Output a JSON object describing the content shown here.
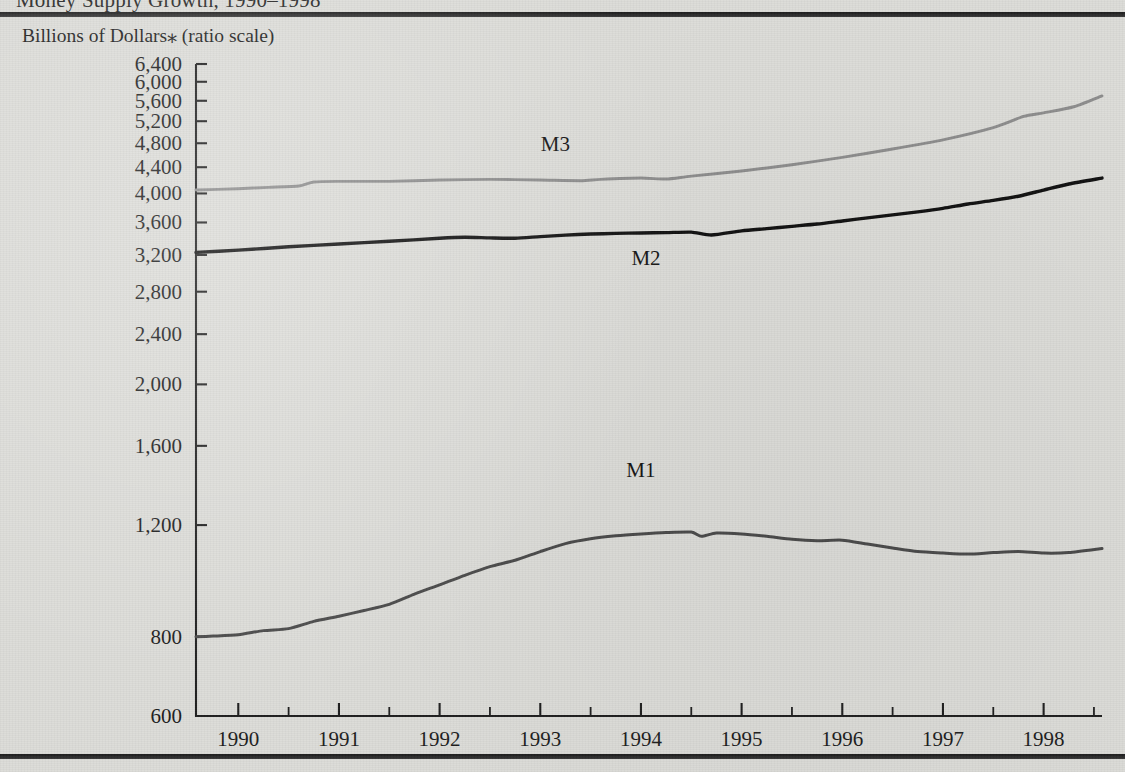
{
  "figure": {
    "clipped_title": "Money Supply Growth, 1990–1998",
    "axis_caption": "Billions of Dollars⁎ (ratio scale)"
  },
  "chart_data": {
    "type": "line",
    "title": "Money Supply Growth, 1990–1998",
    "subtitle": "Billions of Dollars⁎ (ratio scale)",
    "xlabel": "",
    "ylabel": "Billions of Dollars (ratio scale)",
    "scale": "log",
    "grid": false,
    "legend_position": "inline-labels",
    "ylim": [
      600,
      6400
    ],
    "xlim": [
      1989.58,
      1998.58
    ],
    "ytick_labels": [
      "6,400",
      "6,000",
      "5,600",
      "5,200",
      "4,800",
      "4,400",
      "4,000",
      "3,600",
      "3,200",
      "2,800",
      "2,400",
      "2,000",
      "1,600",
      "1,200",
      "800",
      "600"
    ],
    "ytick_values": [
      6400,
      6000,
      5600,
      5200,
      4800,
      4400,
      4000,
      3600,
      3200,
      2800,
      2400,
      2000,
      1600,
      1200,
      800,
      600
    ],
    "xtick_labels": [
      "1990",
      "1991",
      "1992",
      "1993",
      "1994",
      "1995",
      "1996",
      "1997",
      "1998"
    ],
    "xtick_values": [
      1990,
      1991,
      1992,
      1993,
      1994,
      1995,
      1996,
      1997,
      1998
    ],
    "xtick_minor_values": [
      1990.5,
      1991.5,
      1992.5,
      1993.5,
      1994.5,
      1995.5,
      1996.5,
      1997.5,
      1998.5
    ],
    "series": [
      {
        "name": "M1",
        "color": "#4a4a4a",
        "label_x": 1994.0,
        "label_y": 1430,
        "x": [
          1989.58,
          1989.75,
          1990.0,
          1990.25,
          1990.5,
          1990.75,
          1991.0,
          1991.25,
          1991.5,
          1991.75,
          1992.0,
          1992.25,
          1992.5,
          1992.75,
          1993.0,
          1993.25,
          1993.5,
          1993.75,
          1994.0,
          1994.25,
          1994.5,
          1994.6,
          1994.75,
          1995.0,
          1995.25,
          1995.5,
          1995.75,
          1996.0,
          1996.25,
          1996.5,
          1996.75,
          1997.0,
          1997.25,
          1997.5,
          1997.75,
          1998.0,
          1998.25,
          1998.58
        ],
        "y": [
          800,
          802,
          806,
          818,
          824,
          846,
          862,
          880,
          900,
          934,
          966,
          1000,
          1032,
          1056,
          1090,
          1122,
          1142,
          1154,
          1162,
          1168,
          1170,
          1152,
          1166,
          1162,
          1152,
          1140,
          1134,
          1136,
          1120,
          1104,
          1090,
          1084,
          1080,
          1086,
          1090,
          1084,
          1086,
          1102
        ]
      },
      {
        "name": "M2",
        "color": "#111111",
        "label_x": 1994.05,
        "label_y": 3090,
        "x": [
          1989.58,
          1990.0,
          1990.5,
          1991.0,
          1991.5,
          1992.0,
          1992.25,
          1992.5,
          1992.75,
          1993.0,
          1993.25,
          1993.5,
          1993.75,
          1994.0,
          1994.25,
          1994.5,
          1994.7,
          1995.0,
          1995.25,
          1995.5,
          1995.75,
          1996.0,
          1996.25,
          1996.5,
          1996.75,
          1997.0,
          1997.25,
          1997.5,
          1997.75,
          1998.0,
          1998.25,
          1998.58
        ],
        "y": [
          3230,
          3256,
          3296,
          3330,
          3362,
          3400,
          3412,
          3404,
          3400,
          3420,
          3438,
          3452,
          3460,
          3466,
          3470,
          3476,
          3440,
          3492,
          3520,
          3550,
          3580,
          3620,
          3660,
          3700,
          3742,
          3790,
          3850,
          3900,
          3960,
          4050,
          4140,
          4230
        ]
      },
      {
        "name": "M3",
        "color": "#8d8d8d",
        "label_x": 1993.15,
        "label_y": 4660,
        "x": [
          1989.58,
          1990.0,
          1990.3,
          1990.6,
          1990.75,
          1991.0,
          1991.5,
          1992.0,
          1992.5,
          1993.0,
          1993.4,
          1993.6,
          1994.0,
          1994.25,
          1994.5,
          1995.0,
          1995.5,
          1996.0,
          1996.5,
          1997.0,
          1997.5,
          1997.8,
          1998.0,
          1998.3,
          1998.58
        ],
        "y": [
          4050,
          4070,
          4090,
          4110,
          4170,
          4180,
          4180,
          4200,
          4210,
          4200,
          4190,
          4210,
          4230,
          4215,
          4260,
          4340,
          4440,
          4560,
          4700,
          4860,
          5080,
          5290,
          5360,
          5480,
          5700
        ]
      }
    ]
  }
}
